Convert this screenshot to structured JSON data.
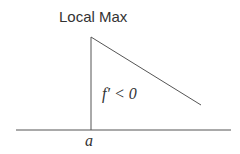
{
  "diagram": {
    "title": "Local Max",
    "region_label": "f′ < 0",
    "point_label": "a",
    "line_color": "#555555",
    "text_color": "#333333"
  }
}
